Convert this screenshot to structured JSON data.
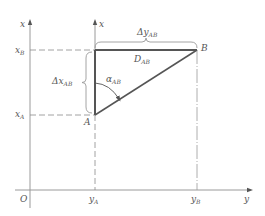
{
  "figure": {
    "type": "coordinate-geometry diagram"
  },
  "axes": {
    "outer_vertical_label": "x",
    "inner_vertical_label": "x",
    "horizontal_label": "y",
    "origin_label": "O"
  },
  "points": {
    "A": {
      "label": "A",
      "x_label": "x",
      "x_sub": "A",
      "y_label": "y",
      "y_sub": "A"
    },
    "B": {
      "label": "B",
      "x_label": "x",
      "x_sub": "B",
      "y_label": "y",
      "y_sub": "B"
    }
  },
  "annotations": {
    "delta_x": {
      "prefix": "Δ",
      "var": "x",
      "sub": "AB"
    },
    "delta_y": {
      "prefix": "Δ",
      "var": "y",
      "sub": "AB"
    },
    "distance": {
      "var": "D",
      "sub": "AB"
    },
    "azimuth": {
      "var": "α",
      "sub": "AB"
    }
  },
  "colors": {
    "axis": "#9a9a9a",
    "thick_line": "#555555",
    "dashed": "#8a8a8a",
    "text": "#555555",
    "background": "#ffffff"
  }
}
